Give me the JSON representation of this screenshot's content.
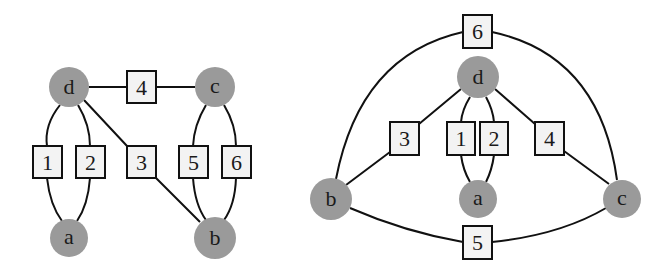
{
  "figure": {
    "colors": {
      "node_fill": "#9a9a9a",
      "label_fill": "#f3f3f3",
      "stroke": "#111111",
      "text": "#1a1a1a"
    },
    "graphs": [
      {
        "name": "left-drawing",
        "nodes": [
          {
            "id": "d",
            "label": "d",
            "x": 69,
            "y": 87,
            "r": 20
          },
          {
            "id": "c",
            "label": "c",
            "x": 215,
            "y": 87,
            "r": 20
          },
          {
            "id": "a",
            "label": "a",
            "x": 69,
            "y": 238,
            "r": 19
          },
          {
            "id": "b",
            "label": "b",
            "x": 215,
            "y": 238,
            "r": 21
          }
        ],
        "edges": [
          {
            "label": "1",
            "from": "d",
            "to": "a",
            "box_x": 33,
            "box_y": 146
          },
          {
            "label": "2",
            "from": "d",
            "to": "a",
            "box_x": 76,
            "box_y": 146
          },
          {
            "label": "3",
            "from": "d",
            "to": "b",
            "box_x": 127,
            "box_y": 146
          },
          {
            "label": "4",
            "from": "d",
            "to": "c",
            "box_x": 127,
            "box_y": 71
          },
          {
            "label": "5",
            "from": "c",
            "to": "b",
            "box_x": 179,
            "box_y": 146
          },
          {
            "label": "6",
            "from": "c",
            "to": "b",
            "box_x": 222,
            "box_y": 146
          }
        ]
      },
      {
        "name": "right-drawing",
        "nodes": [
          {
            "id": "d",
            "label": "d",
            "x": 478,
            "y": 77,
            "r": 21
          },
          {
            "id": "b",
            "label": "b",
            "x": 331,
            "y": 199,
            "r": 21
          },
          {
            "id": "a",
            "label": "a",
            "x": 478,
            "y": 199,
            "r": 19
          },
          {
            "id": "c",
            "label": "c",
            "x": 622,
            "y": 199,
            "r": 19
          }
        ],
        "edges": [
          {
            "label": "1",
            "from": "d",
            "to": "a",
            "box_x": 447,
            "box_y": 122
          },
          {
            "label": "2",
            "from": "d",
            "to": "a",
            "box_x": 480,
            "box_y": 122
          },
          {
            "label": "3",
            "from": "d",
            "to": "b",
            "box_x": 390,
            "box_y": 122
          },
          {
            "label": "4",
            "from": "d",
            "to": "c",
            "box_x": 535,
            "box_y": 122
          },
          {
            "label": "5",
            "from": "b",
            "to": "c",
            "box_x": 463,
            "box_y": 226
          },
          {
            "label": "6",
            "from": "b",
            "to": "c",
            "box_x": 463,
            "box_y": 15
          }
        ]
      }
    ]
  }
}
